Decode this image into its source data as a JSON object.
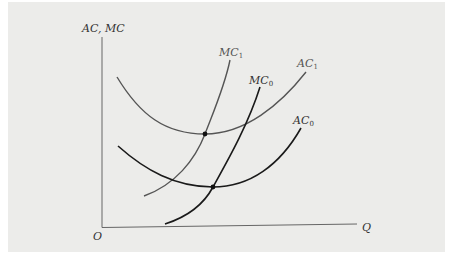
{
  "diagram": {
    "y_axis_label": "AC, MC",
    "x_axis_label": "Q",
    "origin_label": "O",
    "curves": [
      {
        "id": "AC1",
        "name": "AC",
        "subscript": "1",
        "color": "#555555",
        "description": "Higher average cost curve (U-shaped)"
      },
      {
        "id": "MC1",
        "name": "MC",
        "subscript": "1",
        "color": "#555555",
        "description": "Higher marginal cost curve, crosses AC1 at its minimum"
      },
      {
        "id": "MC0",
        "name": "MC",
        "subscript": "0",
        "color": "#1a1a1a",
        "description": "Original marginal cost curve, crosses AC0 at its minimum"
      },
      {
        "id": "AC0",
        "name": "AC",
        "subscript": "0",
        "color": "#1a1a1a",
        "description": "Original average cost curve (U-shaped)"
      }
    ],
    "points": [
      {
        "id": "min-AC1",
        "description": "Intersection of MC1 and AC1 at minimum of AC1"
      },
      {
        "id": "min-AC0",
        "description": "Intersection of MC0 and AC0 at minimum of AC0"
      }
    ]
  }
}
